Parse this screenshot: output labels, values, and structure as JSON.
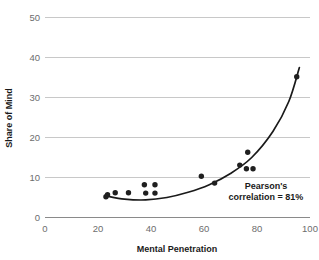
{
  "chart_data": {
    "type": "scatter",
    "title": "",
    "subtitle": "",
    "xlabel": "Mental Penetration",
    "ylabel": "Share of Mind",
    "xlim": [
      0,
      100
    ],
    "ylim": [
      0,
      50
    ],
    "xticks": [
      0,
      20,
      40,
      60,
      80,
      100
    ],
    "yticks": [
      0,
      10,
      20,
      30,
      40,
      50
    ],
    "xtick_labels": [
      "0",
      "20",
      "40",
      "60",
      "80",
      "100"
    ],
    "ytick_labels": [
      "0",
      "10",
      "20",
      "30",
      "40",
      "50"
    ],
    "grid": "horizontal",
    "legend": "none",
    "series": [
      {
        "name": "Brands",
        "marker": "circle",
        "color": "#1f1f1f",
        "points": [
          {
            "x": 23.0,
            "y": 5.2
          },
          {
            "x": 23.6,
            "y": 5.7
          },
          {
            "x": 26.5,
            "y": 6.2
          },
          {
            "x": 31.5,
            "y": 6.2
          },
          {
            "x": 37.5,
            "y": 8.2
          },
          {
            "x": 38.0,
            "y": 6.1
          },
          {
            "x": 41.5,
            "y": 8.2
          },
          {
            "x": 41.5,
            "y": 6.1
          },
          {
            "x": 59.0,
            "y": 10.3
          },
          {
            "x": 64.0,
            "y": 8.6
          },
          {
            "x": 73.5,
            "y": 13.1
          },
          {
            "x": 76.5,
            "y": 16.3
          },
          {
            "x": 76.0,
            "y": 12.2
          },
          {
            "x": 78.5,
            "y": 12.2
          },
          {
            "x": 95.0,
            "y": 35.2
          }
        ]
      }
    ],
    "fit_curve": {
      "name": "exponential-trendline",
      "color": "#1a1a1a",
      "points": [
        {
          "x": 23.0,
          "y": 5.4
        },
        {
          "x": 30.0,
          "y": 4.6
        },
        {
          "x": 38.0,
          "y": 4.4
        },
        {
          "x": 46.0,
          "y": 5.0
        },
        {
          "x": 54.0,
          "y": 6.3
        },
        {
          "x": 62.0,
          "y": 8.2
        },
        {
          "x": 70.0,
          "y": 11.0
        },
        {
          "x": 78.0,
          "y": 15.0
        },
        {
          "x": 86.0,
          "y": 21.5
        },
        {
          "x": 92.0,
          "y": 29.0
        },
        {
          "x": 96.0,
          "y": 37.5
        }
      ]
    },
    "annotations": [
      {
        "name": "pearson-correlation",
        "line1": "Pearson's",
        "line2": "correlation = 81%",
        "x": 77,
        "y": 8.0
      }
    ]
  },
  "colors": {
    "background": "#ffffff",
    "grid": "#c8c8c8",
    "axis": "#8a8a8a",
    "marker": "#1f1f1f",
    "curve": "#1a1a1a",
    "tick_text": "#6d6d6d",
    "title_text": "#1a1a1a"
  }
}
